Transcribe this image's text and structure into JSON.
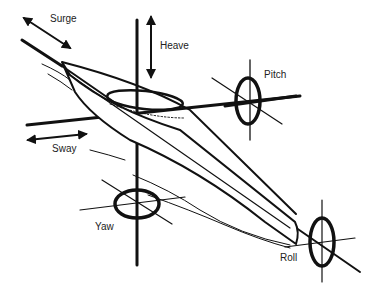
{
  "diagram": {
    "labels": {
      "surge": "Surge",
      "heave": "Heave",
      "sway": "Sway",
      "pitch": "Pitch",
      "yaw": "Yaw",
      "roll": "Roll"
    },
    "colors": {
      "ink": "#111111",
      "background": "#ffffff"
    }
  }
}
